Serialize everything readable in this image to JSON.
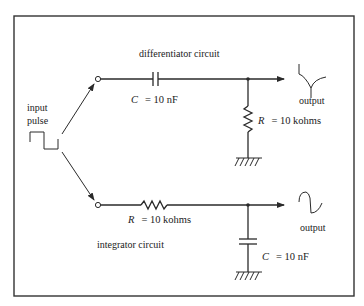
{
  "diagram": {
    "input": {
      "label_line1": "input",
      "label_line2": "pulse"
    },
    "differentiator": {
      "title": "differentiator circuit",
      "capacitor": {
        "symbol": "C",
        "eq": "= 10 nF"
      },
      "resistor": {
        "symbol": "R",
        "eq": "= 10 kohms"
      },
      "output_label": "output"
    },
    "integrator": {
      "title": "integrator circuit",
      "resistor": {
        "symbol": "R",
        "eq": "= 10 kohms"
      },
      "capacitor": {
        "symbol": "C",
        "eq": "= 10 nF"
      },
      "output_label": "output"
    },
    "icons": [
      "square-pulse-icon",
      "spike-waveform-icon",
      "ramp-waveform-icon",
      "ground-icon",
      "capacitor-icon",
      "resistor-icon",
      "arrow-icon"
    ],
    "colors": {
      "ink": "#2a2a2a",
      "frame": "#333333",
      "background": "#ffffff"
    }
  }
}
